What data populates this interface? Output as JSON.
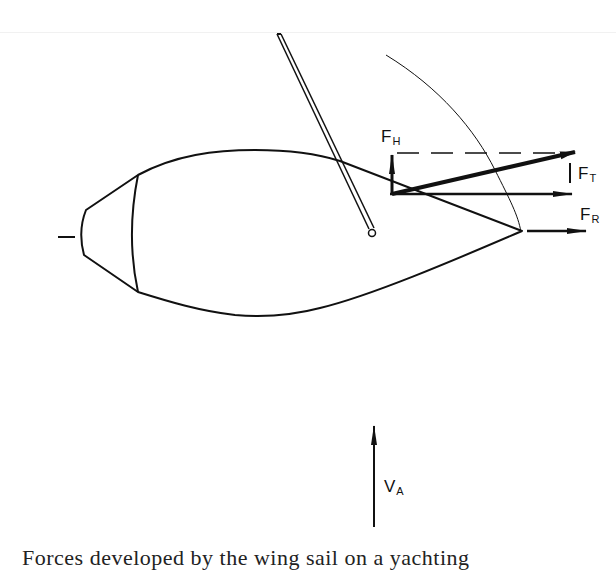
{
  "figure": {
    "labels": {
      "heeling_force": {
        "main": "F",
        "sub": "H"
      },
      "total_force": {
        "main": "F",
        "sub": "T"
      },
      "driving_force": {
        "main": "F",
        "sub": "R"
      },
      "apparent_wind": {
        "main": "V",
        "sub": "A"
      }
    },
    "caption": "Forces developed by the wing sail on a yachting"
  },
  "colors": {
    "ink": "#111111",
    "background": "#ffffff"
  }
}
